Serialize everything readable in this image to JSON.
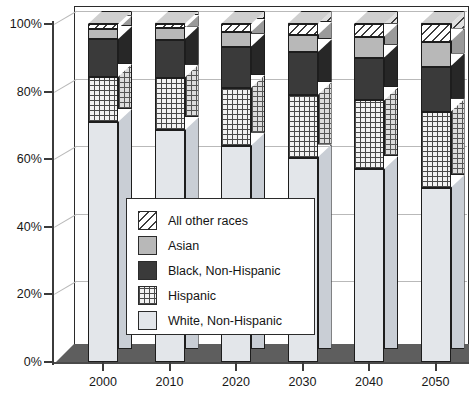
{
  "chart_data": {
    "type": "bar",
    "subtype": "stacked-percentage-3d-column",
    "title": "",
    "xlabel": "",
    "ylabel": "",
    "categories": [
      "2000",
      "2010",
      "2020",
      "2030",
      "2040",
      "2050"
    ],
    "ylim": [
      0,
      100
    ],
    "yticks": [
      0,
      20,
      40,
      60,
      80,
      100
    ],
    "ytick_labels": [
      "0%",
      "20%",
      "40%",
      "60%",
      "80%",
      "100%"
    ],
    "grid": true,
    "legend_position": "center-left-inside",
    "stack_order_bottom_to_top": [
      "White, Non-Hispanic",
      "Hispanic",
      "Black, Non-Hispanic",
      "Asian",
      "All other races"
    ],
    "series": [
      {
        "name": "White, Non-Hispanic",
        "values": [
          71,
          68.5,
          64,
          60.5,
          57,
          51.5
        ]
      },
      {
        "name": "Hispanic",
        "values": [
          13.3,
          15.6,
          17.1,
          18.4,
          20.4,
          22.5
        ]
      },
      {
        "name": "Black, Non-Hispanic",
        "values": [
          11.2,
          11.3,
          12.2,
          12.7,
          12.6,
          13.4
        ]
      },
      {
        "name": "Asian",
        "values": [
          3.1,
          3.3,
          4.3,
          5.1,
          6.2,
          7.4
        ]
      },
      {
        "name": "All other races",
        "values": [
          1.4,
          1.3,
          2.4,
          3.3,
          3.8,
          5.2
        ]
      }
    ],
    "cumulative_tops": [
      [
        71,
        84.3,
        95.5,
        98.6,
        100
      ],
      [
        68.5,
        84.1,
        95.4,
        98.7,
        100
      ],
      [
        64,
        81.1,
        93.3,
        97.6,
        100
      ],
      [
        60.5,
        78.9,
        91.6,
        96.7,
        100
      ],
      [
        57,
        77.4,
        90,
        96.2,
        100
      ],
      [
        51.5,
        74,
        87.4,
        94.8,
        100
      ]
    ]
  },
  "legend": {
    "items": [
      {
        "label": "All other races",
        "pattern": "diagonal-hatch"
      },
      {
        "label": "Asian",
        "pattern": "solid-gray"
      },
      {
        "label": "Black, Non-Hispanic",
        "pattern": "solid-dark"
      },
      {
        "label": "Hispanic",
        "pattern": "crosshatch-grid"
      },
      {
        "label": "White, Non-Hispanic",
        "pattern": "solid-light"
      }
    ]
  },
  "axes": {
    "y_labels": [
      "100%",
      "80%",
      "60%",
      "40%",
      "20%",
      "0%"
    ],
    "x_labels": [
      "2000",
      "2010",
      "2020",
      "2030",
      "2040",
      "2050"
    ]
  },
  "colors": {
    "white_nonhispanic": "#e3e6ea",
    "hispanic": "#f2f2f2",
    "black_nonhispanic": "#3a3a3a",
    "asian": "#b8b8b8",
    "all_other_races": "#ffffff",
    "outline": "#1d1d1d",
    "floor": "#5e5e5e",
    "gridline": "#b9b9b9"
  }
}
